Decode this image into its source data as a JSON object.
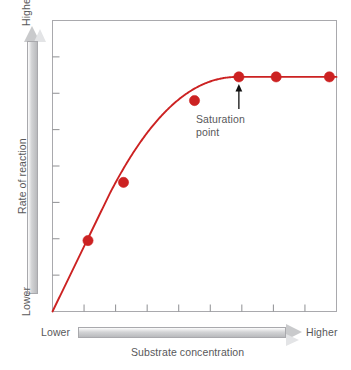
{
  "chart_data": {
    "type": "line",
    "title": "",
    "subtitle": "",
    "xlabel": "Substrate concentration",
    "ylabel": "Rate of reaction",
    "x_axis_low_label": "Lower",
    "x_axis_high_label": "Higher",
    "y_axis_low_label": "Lower",
    "y_axis_high_label": "Higher",
    "grid": false,
    "legend": "none",
    "xlim": [
      0,
      8
    ],
    "ylim": [
      0,
      8
    ],
    "x_tick_count": 8,
    "y_tick_count": 7,
    "x_tick_labels": [],
    "y_tick_labels": [],
    "series": [
      {
        "name": "Rate of reaction vs substrate concentration",
        "color": "#cc2222",
        "marker": "circle",
        "x": [
          1,
          2,
          4,
          5.25,
          6.3,
          7.8
        ],
        "values": [
          1.95,
          3.55,
          5.8,
          6.45,
          6.45,
          6.45
        ]
      }
    ],
    "curve_description": "Rate rises steeply and linearly from the origin, bends over and levels off at a plateau (maximum rate) after the saturation point.",
    "annotations": [
      {
        "name": "saturation-point",
        "text": "Saturation point",
        "text_line1": "Saturation",
        "text_line2": "point",
        "points_to_x": 5.25,
        "points_to_y": 6.45,
        "arrow": "up"
      }
    ],
    "colors": {
      "curve": "#cc2222",
      "marker": "#cc2222",
      "frame": "#a9a9ad",
      "tick": "#8e8f92",
      "text": "#58585a",
      "axis_arrow_fill": "#d3d4d6",
      "background": "#ffffff",
      "annotation_arrow": "#111111"
    }
  }
}
